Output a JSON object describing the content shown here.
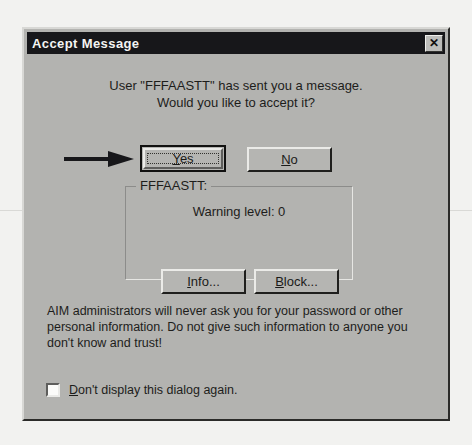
{
  "window": {
    "title": "Accept Message",
    "close_label": "✕",
    "close_icon": "close-icon"
  },
  "message": {
    "line1": "User \"FFFAASTT\" has sent you a message.",
    "line2": "Would you like to accept it?"
  },
  "annotation": {
    "arrow_icon": "right-arrow-icon",
    "points_to": "Yes"
  },
  "buttons": {
    "yes": {
      "prefix": "Y",
      "rest": "es",
      "is_default": true,
      "focused": true
    },
    "no": {
      "prefix": "N",
      "rest": "o",
      "is_default": false,
      "focused": false
    },
    "info": {
      "prefix": "I",
      "rest": "nfo...",
      "is_default": false,
      "focused": false
    },
    "block": {
      "prefix": "B",
      "rest": "lock...",
      "is_default": false,
      "focused": false
    }
  },
  "groupbox": {
    "legend": "FFFAASTT:",
    "warning_level": "Warning level: 0"
  },
  "warning": {
    "line1": "AIM administrators will never ask you for your password or other",
    "line2": "personal information.  Do not give such information to anyone you",
    "line3": "don't know and trust!"
  },
  "checkbox": {
    "checked": false,
    "prefix": "D",
    "rest": "on't display this dialog again."
  },
  "colors": {
    "dialog_face": "#b3b3b0",
    "titlebar": "#17171a",
    "titlebar_text": "#f4f4f2",
    "text": "#1d1d1b",
    "page_background": "#f2f2f0"
  }
}
